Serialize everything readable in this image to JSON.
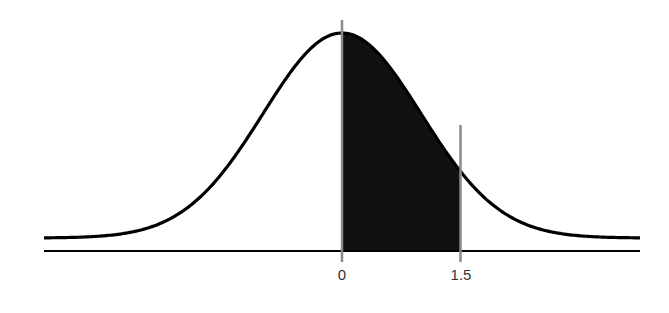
{
  "chart_data": {
    "type": "area",
    "title": "",
    "xlabel": "",
    "ylabel": "",
    "distribution": "standard normal",
    "xlim": [
      -3.77,
      3.77
    ],
    "shaded_region": {
      "from": 0,
      "to": 1.5
    },
    "tick_labels": [
      {
        "value": 0,
        "label": "0"
      },
      {
        "value": 1.5,
        "label": "1.5"
      }
    ],
    "vertical_markers": [
      0,
      1.5
    ],
    "grid": false,
    "legend": null,
    "colors": {
      "curve": "#000000",
      "shade": "#111111",
      "markers": "#8a8a8a",
      "axis": "#000000"
    }
  },
  "labels": {
    "tick_0": "0",
    "tick_1_5": "1.5"
  }
}
